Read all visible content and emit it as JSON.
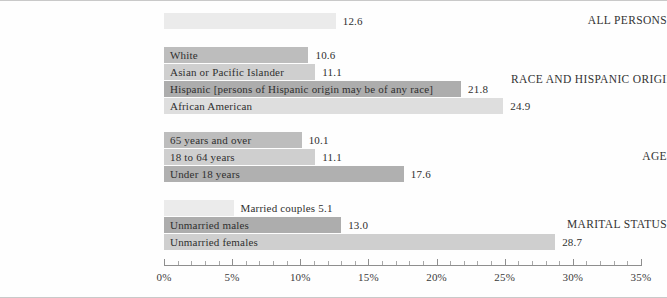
{
  "chart_data": {
    "type": "bar",
    "orientation": "horizontal",
    "title": "",
    "xlabel": "",
    "ylabel": "",
    "xlim": [
      0,
      35
    ],
    "xunit": "%",
    "grid": false,
    "legend": "none",
    "axis": {
      "major_ticks": [
        0,
        5,
        10,
        15,
        20,
        25,
        30,
        35
      ],
      "tick_labels": [
        "0%",
        "5%",
        "10%",
        "15%",
        "20%",
        "25%",
        "30%",
        "35%"
      ],
      "minor_tick_step": 1
    },
    "groups": [
      {
        "label": "ALL PERSONS",
        "bars": [
          {
            "name": "All persons",
            "value": 12.6,
            "value_label": "12.6",
            "bar_label": "",
            "label_position": "none",
            "color": "#ebebeb"
          }
        ]
      },
      {
        "label": "RACE AND HISPANIC ORIGIN",
        "bars": [
          {
            "name": "White",
            "value": 10.6,
            "value_label": "10.6",
            "bar_label": "White",
            "label_position": "inside",
            "color": "#bdbdbd"
          },
          {
            "name": "Asian or Pacific Islander",
            "value": 11.1,
            "value_label": "11.1",
            "bar_label": "Asian or Pacific Islander",
            "label_position": "inside",
            "color": "#cfcfcf"
          },
          {
            "name": "Hispanic",
            "value": 21.8,
            "value_label": "21.8",
            "bar_label": "Hispanic [persons of Hispanic origin may be of any race]",
            "label_position": "inside",
            "color": "#adadad"
          },
          {
            "name": "African American",
            "value": 24.9,
            "value_label": "24.9",
            "bar_label": "African American",
            "label_position": "inside",
            "color": "#dedede"
          }
        ]
      },
      {
        "label": "AGE",
        "bars": [
          {
            "name": "65 years and over",
            "value": 10.1,
            "value_label": "10.1",
            "bar_label": "65 years and over",
            "label_position": "inside",
            "color": "#bdbdbd"
          },
          {
            "name": "18 to 64 years",
            "value": 11.1,
            "value_label": "11.1",
            "bar_label": "18 to 64 years",
            "label_position": "inside",
            "color": "#cfcfcf"
          },
          {
            "name": "Under 18 years",
            "value": 17.6,
            "value_label": "17.6",
            "bar_label": "Under 18 years",
            "label_position": "inside",
            "color": "#b0b0b0"
          }
        ]
      },
      {
        "label": "MARITAL STATUS",
        "bars": [
          {
            "name": "Married couples",
            "value": 5.1,
            "value_label": "",
            "bar_label": "Married couples 5.1",
            "label_position": "outside",
            "color": "#ebebeb"
          },
          {
            "name": "Unmarried males",
            "value": 13.0,
            "value_label": "13.0",
            "bar_label": "Unmarried males",
            "label_position": "inside",
            "color": "#adadad"
          },
          {
            "name": "Unmarried females",
            "value": 28.7,
            "value_label": "28.7",
            "bar_label": "Unmarried females",
            "label_position": "inside",
            "color": "#cfcfcf"
          }
        ]
      }
    ]
  }
}
